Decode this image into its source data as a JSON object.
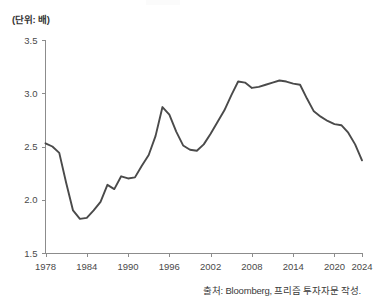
{
  "unit_label": "(단위: 배)",
  "source_note": "출처: Bloomberg, 프리즘 투자자문 작성.",
  "colors": {
    "line": "#4a4a4a",
    "axis": "#8c8c8c",
    "text": "#4a4a4a",
    "background": "#ffffff"
  },
  "chart_data": {
    "type": "line",
    "title": "",
    "subtitle": "",
    "xlabel": "",
    "ylabel": "(단위: 배)",
    "xlim": [
      1978,
      2024
    ],
    "ylim": [
      1.5,
      3.5
    ],
    "grid": false,
    "legend": false,
    "legend_position": "none",
    "yticks": [
      "1.5",
      "2.0",
      "2.5",
      "3.0",
      "3.5"
    ],
    "ytick_values": [
      1.5,
      2.0,
      2.5,
      3.0,
      3.5
    ],
    "xticks": [
      "1978",
      "1984",
      "1990",
      "1996",
      "2002",
      "2008",
      "2014",
      "2020",
      "2024"
    ],
    "xtick_values": [
      1978,
      1984,
      1990,
      1996,
      2002,
      2008,
      2014,
      2020,
      2024
    ],
    "series": [
      {
        "name": "",
        "x": [
          1978,
          1979,
          1980,
          1981,
          1982,
          1983,
          1984,
          1985,
          1986,
          1987,
          1988,
          1989,
          1990,
          1991,
          1992,
          1993,
          1994,
          1995,
          1996,
          1997,
          1998,
          1999,
          2000,
          2001,
          2002,
          2003,
          2004,
          2005,
          2006,
          2007,
          2008,
          2009,
          2010,
          2011,
          2012,
          2013,
          2014,
          2015,
          2016,
          2017,
          2018,
          2019,
          2020,
          2021,
          2022,
          2023,
          2024
        ],
        "values": [
          2.53,
          2.5,
          2.44,
          2.16,
          1.9,
          1.82,
          1.83,
          1.9,
          1.98,
          2.14,
          2.1,
          2.22,
          2.2,
          2.21,
          2.32,
          2.42,
          2.6,
          2.87,
          2.8,
          2.64,
          2.51,
          2.47,
          2.46,
          2.52,
          2.62,
          2.73,
          2.84,
          2.98,
          3.11,
          3.1,
          3.05,
          3.06,
          3.08,
          3.1,
          3.12,
          3.11,
          3.09,
          3.08,
          2.95,
          2.83,
          2.78,
          2.74,
          2.71,
          2.7,
          2.63,
          2.52,
          2.37
        ]
      }
    ]
  }
}
